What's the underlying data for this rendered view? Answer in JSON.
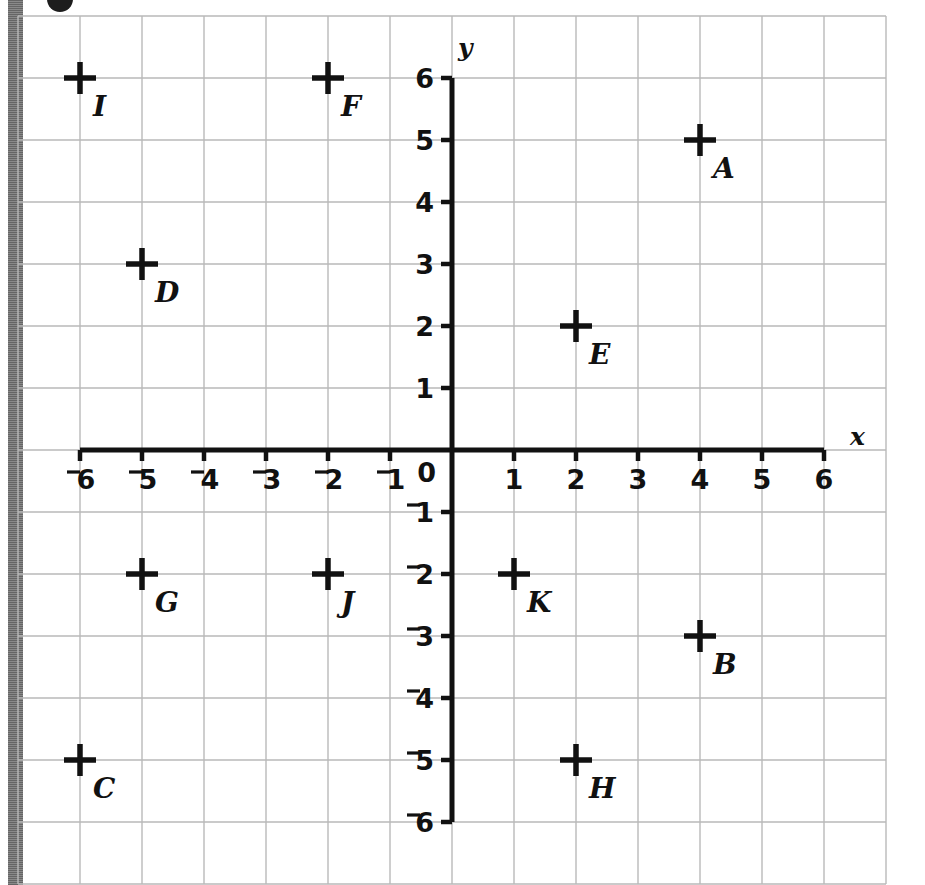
{
  "figure": {
    "kind": "coordinate-plane",
    "x_axis_name": "x",
    "y_axis_name": "y",
    "origin_label": "0"
  },
  "chart_data": {
    "type": "scatter",
    "title": "",
    "xlabel": "x",
    "ylabel": "y",
    "xlim": [
      -6,
      6
    ],
    "ylim": [
      -6,
      6
    ],
    "grid": true,
    "legend": "none",
    "marker": "plus-cross",
    "xticks": [
      "⁻6",
      "⁻5",
      "⁻4",
      "⁻3",
      "⁻2",
      "⁻1",
      "1",
      "2",
      "3",
      "4",
      "5",
      "6"
    ],
    "xtick_values": [
      -6,
      -5,
      -4,
      -3,
      -2,
      -1,
      1,
      2,
      3,
      4,
      5,
      6
    ],
    "yticks": [
      "6",
      "5",
      "4",
      "3",
      "2",
      "1",
      "⁻1",
      "⁻2",
      "⁻3",
      "⁻4",
      "⁻5",
      "⁻6"
    ],
    "ytick_values": [
      6,
      5,
      4,
      3,
      2,
      1,
      -1,
      -2,
      -3,
      -4,
      -5,
      -6
    ],
    "origin_tick": "0",
    "points": [
      {
        "label": "A",
        "x": 4,
        "y": 5
      },
      {
        "label": "B",
        "x": 4,
        "y": -3
      },
      {
        "label": "C",
        "x": -6,
        "y": -5
      },
      {
        "label": "D",
        "x": -5,
        "y": 3
      },
      {
        "label": "E",
        "x": 2,
        "y": 2
      },
      {
        "label": "F",
        "x": -2,
        "y": 6
      },
      {
        "label": "G",
        "x": -5,
        "y": -2
      },
      {
        "label": "H",
        "x": 2,
        "y": -5
      },
      {
        "label": "I",
        "x": -6,
        "y": 6
      },
      {
        "label": "J",
        "x": -2,
        "y": -2
      },
      {
        "label": "K",
        "x": 1,
        "y": -2
      }
    ]
  },
  "colors": {
    "grid_line": "#b9b9b9",
    "axis_line": "#111111",
    "marker": "#111111",
    "text": "#111111",
    "background": "#ffffff"
  }
}
